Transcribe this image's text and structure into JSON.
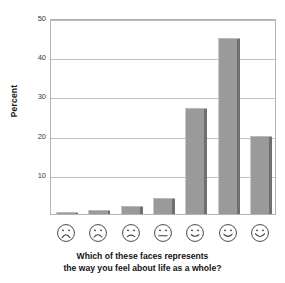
{
  "chart_data": {
    "type": "bar",
    "title": "",
    "subtitle": "",
    "xlabel": "Which of these faces represents the way you feel about life as a whole?",
    "ylabel": "Percent",
    "ylim": [
      0,
      50
    ],
    "ytick_labels": [
      "10",
      "20",
      "30",
      "40",
      "50"
    ],
    "ytick_values": [
      10,
      20,
      30,
      40,
      50
    ],
    "grid": true,
    "legend": "none",
    "categories": [
      "very-sad-face",
      "sad-face",
      "slightly-sad-face",
      "neutral-face",
      "slightly-happy-face",
      "happy-face",
      "very-happy-face"
    ],
    "category_labels": [
      "Face 1 (most unhappy)",
      "Face 2",
      "Face 3",
      "Face 4 (neutral)",
      "Face 5",
      "Face 6",
      "Face 7 (most happy)"
    ],
    "values": [
      0.5,
      1,
      2,
      4,
      27,
      45,
      20
    ],
    "bar_color": "#9a9a9a",
    "bar_shadow_color": "#6f6f6f",
    "grid_color": "#bfbfbf",
    "axis_color": "#b4b4b4",
    "plot_background": "#ffffff"
  },
  "axis": {
    "y_title": "Percent"
  },
  "caption": {
    "line1": "Which of these faces represents",
    "line2": "the way you feel about life as a whole?"
  },
  "faces": [
    {
      "name": "very-sad-face",
      "mouth": "deep-frown"
    },
    {
      "name": "sad-face",
      "mouth": "frown"
    },
    {
      "name": "slightly-sad-face",
      "mouth": "slight-frown"
    },
    {
      "name": "neutral-face",
      "mouth": "flat"
    },
    {
      "name": "slightly-happy-face",
      "mouth": "slight-smile"
    },
    {
      "name": "happy-face",
      "mouth": "smile"
    },
    {
      "name": "very-happy-face",
      "mouth": "big-smile"
    }
  ]
}
